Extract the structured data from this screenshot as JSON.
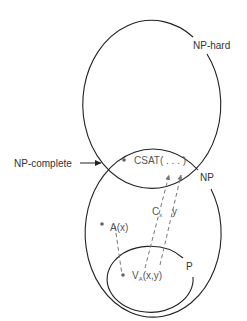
{
  "diagram": {
    "sets": {
      "np_hard": "NP-hard",
      "np": "NP",
      "p": "P",
      "np_complete": "NP-complete"
    },
    "nodes": {
      "csat": "CSAT( . . . )",
      "a": "A(x)",
      "verifier_main": "V",
      "verifier_sub": "A",
      "verifier_args": "(x,y)"
    },
    "edge_labels": {
      "cx_main": "C",
      "cx_sub": "x",
      "y": "y"
    },
    "colors": {
      "outline": "#222222",
      "label": "#555555",
      "dashed": "#777777"
    }
  }
}
